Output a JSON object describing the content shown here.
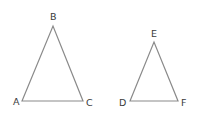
{
  "figure": {
    "line_color": "#8a8a8a",
    "label_color": "#3a3a3a"
  },
  "triangles": [
    {
      "name": "ABC",
      "vertices": {
        "A": {
          "label": "A",
          "x": 22,
          "y": 101,
          "label_x": 13,
          "label_y": 105
        },
        "B": {
          "label": "B",
          "x": 53,
          "y": 26,
          "label_x": 50,
          "label_y": 20
        },
        "C": {
          "label": "C",
          "x": 83,
          "y": 101,
          "label_x": 86,
          "label_y": 106
        }
      }
    },
    {
      "name": "DEF",
      "vertices": {
        "D": {
          "label": "D",
          "x": 130,
          "y": 101,
          "label_x": 119,
          "label_y": 106
        },
        "E": {
          "label": "E",
          "x": 154,
          "y": 42,
          "label_x": 151,
          "label_y": 37
        },
        "F": {
          "label": "F",
          "x": 178,
          "y": 101,
          "label_x": 181,
          "label_y": 106
        }
      }
    }
  ]
}
